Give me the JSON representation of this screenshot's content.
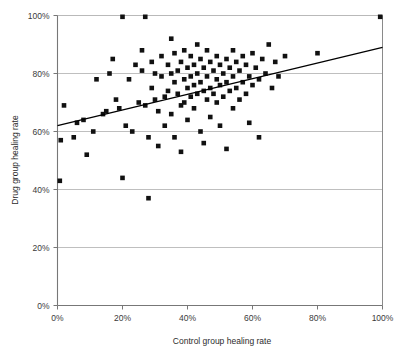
{
  "chart_data": {
    "type": "scatter",
    "title": "",
    "xlabel": "Control group healing rate",
    "ylabel": "Drug group healing rate",
    "xlim": [
      0,
      100
    ],
    "ylim": [
      0,
      100
    ],
    "xticks": [
      0,
      20,
      40,
      60,
      80,
      100
    ],
    "yticks": [
      0,
      20,
      40,
      60,
      80,
      100
    ],
    "xtick_labels": [
      "0%",
      "20%",
      "40%",
      "60%",
      "80%",
      "100%"
    ],
    "ytick_labels": [
      "0%",
      "20%",
      "40%",
      "60%",
      "80%",
      "100%"
    ],
    "grid": "horizontal",
    "legend": "none",
    "marker": "square",
    "marker_color": "#111111",
    "marker_size_px": 4.6,
    "series": [
      {
        "name": "Trials",
        "points": [
          [
            0,
            43
          ],
          [
            1,
            57
          ],
          [
            2,
            69
          ],
          [
            5,
            58
          ],
          [
            6,
            63
          ],
          [
            8,
            64
          ],
          [
            9,
            52
          ],
          [
            11,
            60
          ],
          [
            12,
            78
          ],
          [
            14,
            66
          ],
          [
            15,
            67
          ],
          [
            16,
            80
          ],
          [
            17,
            85
          ],
          [
            18,
            71
          ],
          [
            19,
            68
          ],
          [
            20,
            100
          ],
          [
            20,
            44
          ],
          [
            21,
            62
          ],
          [
            22,
            78
          ],
          [
            23,
            60
          ],
          [
            24,
            83
          ],
          [
            25,
            70
          ],
          [
            26,
            81
          ],
          [
            26,
            88
          ],
          [
            27,
            100
          ],
          [
            27,
            69
          ],
          [
            28,
            37
          ],
          [
            28,
            58
          ],
          [
            29,
            84
          ],
          [
            29,
            75
          ],
          [
            30,
            80
          ],
          [
            30,
            71
          ],
          [
            31,
            67
          ],
          [
            31,
            55
          ],
          [
            32,
            86
          ],
          [
            32,
            79
          ],
          [
            33,
            72
          ],
          [
            33,
            62
          ],
          [
            34,
            83
          ],
          [
            34,
            74
          ],
          [
            35,
            92
          ],
          [
            35,
            80
          ],
          [
            35,
            66
          ],
          [
            36,
            87
          ],
          [
            36,
            77
          ],
          [
            36,
            58
          ],
          [
            37,
            81
          ],
          [
            37,
            73
          ],
          [
            38,
            84
          ],
          [
            38,
            69
          ],
          [
            38,
            53
          ],
          [
            39,
            88
          ],
          [
            39,
            78
          ],
          [
            39,
            70
          ],
          [
            40,
            82
          ],
          [
            40,
            75
          ],
          [
            40,
            64
          ],
          [
            41,
            86
          ],
          [
            41,
            79
          ],
          [
            41,
            72
          ],
          [
            42,
            83
          ],
          [
            42,
            76
          ],
          [
            42,
            68
          ],
          [
            43,
            90
          ],
          [
            43,
            80
          ],
          [
            43,
            73
          ],
          [
            44,
            85
          ],
          [
            44,
            77
          ],
          [
            44,
            60
          ],
          [
            45,
            82
          ],
          [
            45,
            74
          ],
          [
            45,
            56
          ],
          [
            46,
            88
          ],
          [
            46,
            79
          ],
          [
            46,
            71
          ],
          [
            47,
            84
          ],
          [
            47,
            75
          ],
          [
            47,
            65
          ],
          [
            48,
            81
          ],
          [
            48,
            73
          ],
          [
            49,
            86
          ],
          [
            49,
            78
          ],
          [
            49,
            70
          ],
          [
            50,
            83
          ],
          [
            50,
            76
          ],
          [
            50,
            62
          ],
          [
            51,
            80
          ],
          [
            51,
            72
          ],
          [
            52,
            85
          ],
          [
            52,
            77
          ],
          [
            52,
            54
          ],
          [
            53,
            82
          ],
          [
            53,
            74
          ],
          [
            54,
            88
          ],
          [
            54,
            79
          ],
          [
            54,
            68
          ],
          [
            55,
            84
          ],
          [
            55,
            75
          ],
          [
            56,
            81
          ],
          [
            56,
            71
          ],
          [
            57,
            86
          ],
          [
            57,
            77
          ],
          [
            58,
            83
          ],
          [
            58,
            73
          ],
          [
            59,
            79
          ],
          [
            59,
            63
          ],
          [
            60,
            87
          ],
          [
            60,
            76
          ],
          [
            61,
            82
          ],
          [
            62,
            78
          ],
          [
            62,
            58
          ],
          [
            63,
            85
          ],
          [
            64,
            80
          ],
          [
            65,
            90
          ],
          [
            66,
            75
          ],
          [
            67,
            84
          ],
          [
            68,
            79
          ],
          [
            70,
            86
          ],
          [
            80,
            87
          ],
          [
            100,
            100
          ]
        ]
      }
    ],
    "trendline": {
      "name": "Linear fit",
      "x_start": 0,
      "y_start": 62,
      "x_end": 100,
      "y_end": 89,
      "color": "#000000"
    }
  }
}
